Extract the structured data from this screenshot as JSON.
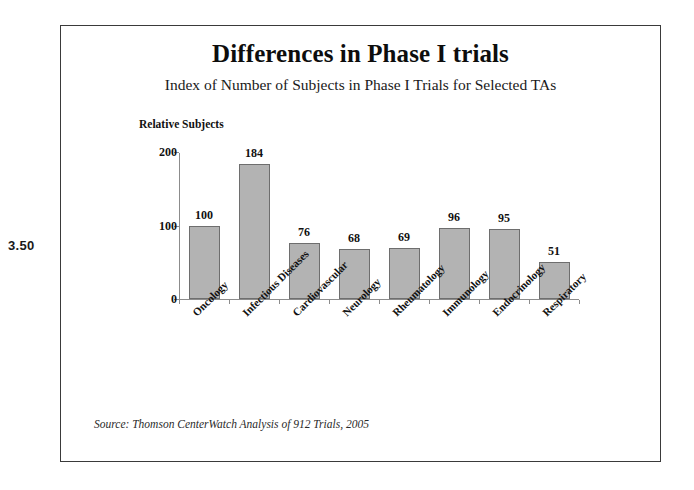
{
  "margin_annotation": "3.50",
  "slide": {
    "title": "Differences in Phase I trials",
    "subtitle": "Index of Number of Subjects in Phase I Trials for Selected TAs",
    "source_note": "Source: Thomson CenterWatch Analysis of 912 Trials, 2005"
  },
  "chart_data": {
    "type": "bar",
    "title": "Differences in Phase I trials",
    "subtitle": "Index of Number of Subjects in Phase I Trials for Selected TAs",
    "xlabel": "",
    "ylabel": "Relative Subjects",
    "ylim": [
      0,
      200
    ],
    "yticks": [
      0,
      100,
      200
    ],
    "ytick_labels": [
      "0",
      "100",
      "200"
    ],
    "grid": false,
    "legend": false,
    "bar_color": "#b3b3b3",
    "bar_edge_color": "#6e6e6e",
    "categories": [
      "Oncology",
      "Infectious Diseases",
      "Cardiovascular",
      "Neurology",
      "Rheumatology",
      "Immunology",
      "Endocrinology",
      "Respiratory"
    ],
    "values": [
      100,
      184,
      76,
      68,
      69,
      96,
      95,
      51
    ],
    "value_labels": [
      "100",
      "184",
      "76",
      "68",
      "69",
      "96",
      "95",
      "51"
    ],
    "source": "Source: Thomson CenterWatch Analysis of 912 Trials, 2005"
  }
}
